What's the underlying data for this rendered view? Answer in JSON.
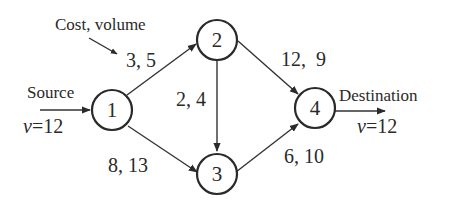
{
  "diagram": {
    "type": "flow-network",
    "annotation": {
      "label": "Cost, volume",
      "points_to_edge": "1-2"
    },
    "source": {
      "label": "Source",
      "flow_label_var": "v",
      "flow_label_rest": "=12",
      "node": "1"
    },
    "destination": {
      "label": "Destination",
      "flow_label_var": "v",
      "flow_label_rest": "=12",
      "node": "4"
    },
    "nodes": [
      {
        "id": "1",
        "label": "1"
      },
      {
        "id": "2",
        "label": "2"
      },
      {
        "id": "3",
        "label": "3"
      },
      {
        "id": "4",
        "label": "4"
      }
    ],
    "edges": [
      {
        "from": "1",
        "to": "2",
        "cost": 3,
        "volume": 5,
        "label": "3, 5"
      },
      {
        "from": "1",
        "to": "3",
        "cost": 8,
        "volume": 13,
        "label": "8, 13"
      },
      {
        "from": "2",
        "to": "3",
        "cost": 2,
        "volume": 4,
        "label": "2, 4"
      },
      {
        "from": "2",
        "to": "4",
        "cost": 12,
        "volume": 9,
        "label": "12,  9"
      },
      {
        "from": "3",
        "to": "4",
        "cost": 6,
        "volume": 10,
        "label": "6, 10"
      }
    ],
    "colors": {
      "stroke": "#2a2a2a",
      "background": "#ffffff"
    }
  }
}
